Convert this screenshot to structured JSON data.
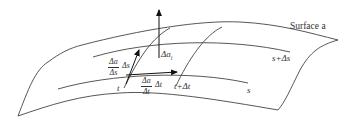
{
  "figure": {
    "surface_label": "Surface a",
    "curve_labels": {
      "s": "s",
      "s_plus": "s+Δs",
      "t": "t",
      "t_plus": "t+Δt"
    },
    "normal_label": "Δa",
    "normal_subscript": "i",
    "vector_s": {
      "num": "Δa",
      "den": "Δs",
      "mult": "Δs"
    },
    "vector_t": {
      "num": "Δa",
      "den": "Δt",
      "mult": "Δt"
    },
    "colors": {
      "stroke": "#444444",
      "background": "#ffffff"
    }
  }
}
